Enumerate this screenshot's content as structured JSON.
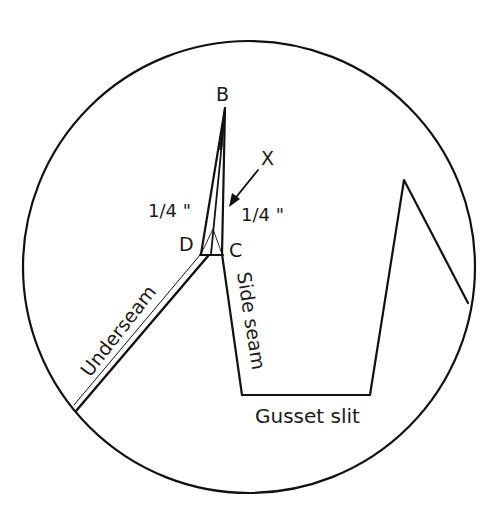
{
  "diagram": {
    "type": "sewing-pattern-detail",
    "colors": {
      "background": "#ffffff",
      "line": "#111111",
      "text": "#1a1a1a"
    },
    "labels": {
      "point_b": "B",
      "point_c": "C",
      "point_d": "D",
      "point_x": "X",
      "measure_left": "1/4 \"",
      "measure_right": "1/4 \"",
      "underseam": "Underseam",
      "side_seam": "Side seam",
      "gusset_slit": "Gusset slit"
    },
    "geometry": {
      "circle": {
        "cx": 249,
        "cy": 267,
        "r": 226
      },
      "point_b": [
        225,
        108
      ],
      "point_c": [
        222,
        254
      ],
      "point_d": [
        201,
        254
      ],
      "side_seam_bottom": [
        242,
        395
      ],
      "gusset_bottom_right": [
        370,
        395
      ],
      "gusset_peak": [
        404,
        180
      ],
      "gusset_circle_end": [
        468,
        303
      ],
      "underseam_circle_end": [
        76,
        411
      ]
    }
  }
}
